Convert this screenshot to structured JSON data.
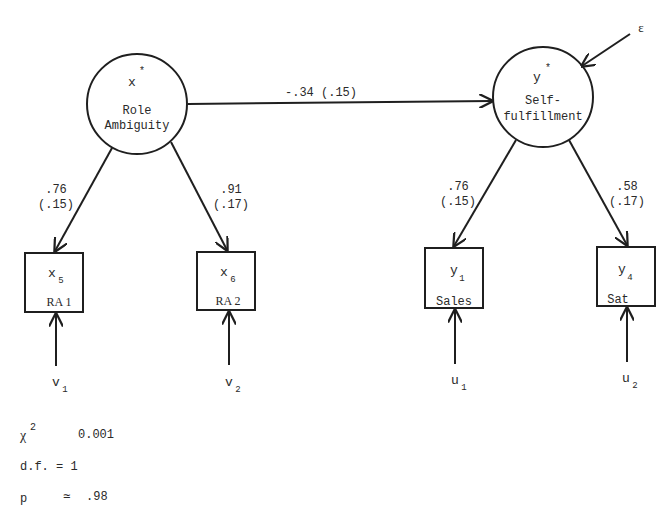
{
  "latent": {
    "x": {
      "symbol": "x",
      "star": "*",
      "line1": "Role",
      "line2": "Ambiguity"
    },
    "y": {
      "symbol": "y",
      "star": "*",
      "line1": "Self-",
      "line2": "fulfillment"
    }
  },
  "structural_path": {
    "label": "-.34 (.15)"
  },
  "disturbance": {
    "label": "ε"
  },
  "loadings": {
    "x5": {
      "estimate": ".76",
      "se": "(.15)"
    },
    "x6": {
      "estimate": ".91",
      "se": "(.17)"
    },
    "y1": {
      "estimate": ".76",
      "se": "(.15)"
    },
    "y4": {
      "estimate": ".58",
      "se": "(.17)"
    }
  },
  "indicators": {
    "x5": {
      "symbol": "x",
      "sub": "5",
      "name": "RA 1"
    },
    "x6": {
      "symbol": "x",
      "sub": "6",
      "name": "RA 2"
    },
    "y1": {
      "symbol": "y",
      "sub": "1",
      "name": "Sales"
    },
    "y4": {
      "symbol": "y",
      "sub": "4",
      "name": "Sat"
    }
  },
  "errors": {
    "v1": {
      "symbol": "v",
      "sub": "1"
    },
    "v2": {
      "symbol": "v",
      "sub": "2"
    },
    "u1": {
      "symbol": "u",
      "sub": "1"
    },
    "u2": {
      "symbol": "u",
      "sub": "2"
    }
  },
  "stats": {
    "chi_symbol": "χ",
    "chi_sup": "2",
    "chi_value": "0.001",
    "df_label": "d.f. = 1",
    "p_label": "p",
    "p_approx": "≃",
    "p_value": ".98"
  }
}
